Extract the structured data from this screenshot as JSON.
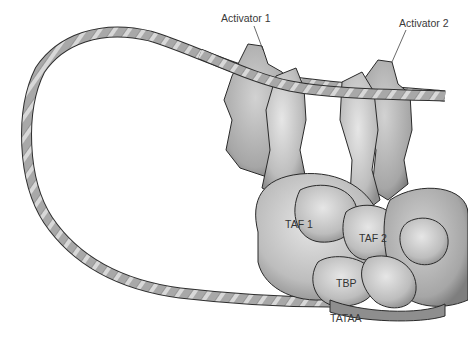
{
  "diagram": {
    "labels": {
      "activator1": "Activator 1",
      "activator2": "Activator 2",
      "taf1": "TAF 1",
      "taf2": "TAF 2",
      "tbp": "TBP",
      "tataa": "TATAA"
    },
    "colors": {
      "background": "#ffffff",
      "rope": "#9a9a9a",
      "protein": "#c4c4c4",
      "outline": "#2a2a2a",
      "text": "#3a3a3a"
    }
  }
}
